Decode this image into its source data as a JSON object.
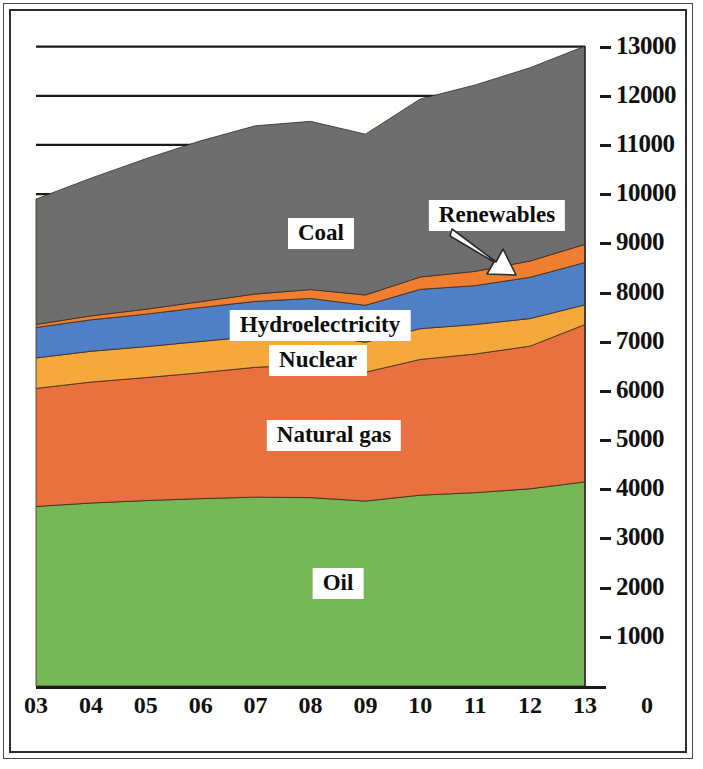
{
  "chart_data": {
    "type": "area",
    "stacked": true,
    "title": "",
    "subtitle": "",
    "xlabel": "",
    "ylabel": "",
    "grid": true,
    "grid_axis": "y",
    "legend_position": "inline-callouts",
    "x": [
      "03",
      "04",
      "05",
      "06",
      "07",
      "08",
      "09",
      "10",
      "11",
      "12",
      "13"
    ],
    "x_tick_labels": [
      "03",
      "04",
      "05",
      "06",
      "07",
      "08",
      "09",
      "10",
      "11",
      "12",
      "13",
      "0"
    ],
    "y_tick_labels": [
      "13000",
      "12000",
      "11000",
      "10000",
      "9000",
      "8000",
      "7000",
      "6000",
      "5000",
      "4000",
      "3000",
      "2000",
      "1000"
    ],
    "y_ticks": [
      13000,
      12000,
      11000,
      10000,
      9000,
      8000,
      7000,
      6000,
      5000,
      4000,
      3000,
      2000,
      1000
    ],
    "ylim": [
      0,
      13500
    ],
    "series": [
      {
        "name": "Oil",
        "color": "#76b856",
        "values": [
          3650,
          3720,
          3770,
          3810,
          3840,
          3830,
          3760,
          3880,
          3930,
          4010,
          4150
        ]
      },
      {
        "name": "Natural gas",
        "color": "#e8713f",
        "values": [
          2400,
          2460,
          2500,
          2560,
          2640,
          2700,
          2620,
          2760,
          2820,
          2900,
          3200
        ]
      },
      {
        "name": "Nuclear",
        "color": "#f5a83c",
        "values": [
          620,
          625,
          630,
          635,
          630,
          620,
          610,
          625,
          600,
          560,
          400
        ]
      },
      {
        "name": "Hydroelectricity",
        "color": "#4f7fc4",
        "values": [
          620,
          640,
          660,
          690,
          710,
          730,
          750,
          800,
          790,
          840,
          860
        ]
      },
      {
        "name": "Renewables",
        "color": "#ef7e30",
        "values": [
          60,
          80,
          100,
          120,
          150,
          180,
          210,
          250,
          290,
          330,
          370
        ]
      },
      {
        "name": "Coal",
        "color": "#6e6e6e",
        "values": [
          2550,
          2800,
          3060,
          3270,
          3420,
          3420,
          3270,
          3620,
          3790,
          3930,
          4030
        ]
      }
    ],
    "series_totals": [
      9900,
      10325,
      10720,
      11085,
      11390,
      11480,
      11220,
      11935,
      12220,
      12570,
      13010
    ],
    "callouts": [
      {
        "name": "Coal",
        "x_px": 321,
        "y_px": 218
      },
      {
        "name": "Renewables",
        "x_px": 497,
        "y_px": 200,
        "has_arrow": true
      },
      {
        "name": "Hydroelectricity",
        "x_px": 320,
        "y_px": 310
      },
      {
        "name": "Nuclear",
        "x_px": 318,
        "y_px": 345
      },
      {
        "name": "Natural gas",
        "x_px": 334,
        "y_px": 420
      },
      {
        "name": "Oil",
        "x_px": 338,
        "y_px": 568
      }
    ]
  },
  "colors": {
    "oil": "#76b856",
    "natural_gas": "#e8713f",
    "nuclear": "#f5a83c",
    "hydroelectricity": "#4f7fc4",
    "renewables": "#ef7e30",
    "coal": "#6e6e6e",
    "axis": "#111111",
    "gridline": "#1a1a1a",
    "frame": "#2d2d2d",
    "background": "#ffffff"
  }
}
